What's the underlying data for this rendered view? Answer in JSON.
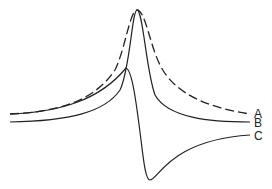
{
  "diagram": {
    "type": "line-curves",
    "curves": [
      {
        "id": "A",
        "label": "A",
        "style": "dashed",
        "description": "broad Lorentzian-like peak"
      },
      {
        "id": "B",
        "label": "B",
        "style": "solid",
        "description": "narrow peak"
      },
      {
        "id": "C",
        "label": "C",
        "style": "solid",
        "description": "dispersive derivative-like curve"
      }
    ],
    "line_color": "#222222"
  }
}
